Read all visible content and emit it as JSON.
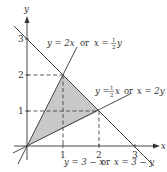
{
  "figure": {
    "type": "region-diagram",
    "axes": {
      "x_label": "x",
      "y_label": "y",
      "x_ticks": [
        "1",
        "2",
        "3"
      ],
      "y_ticks": [
        "1",
        "2",
        "3"
      ]
    },
    "lines": [
      {
        "id": "line-y-2x",
        "label_left": "y = 2x",
        "label_or": "or",
        "label_right_prefix": "x =",
        "label_frac_num": "1",
        "label_frac_den": "2",
        "label_right_suffix": "y"
      },
      {
        "id": "line-y-half-x",
        "label_left_prefix": "y =",
        "label_frac_num": "1",
        "label_frac_den": "2",
        "label_left_suffix": "x",
        "label_or": "or",
        "label_right": "x = 2y"
      },
      {
        "id": "line-y-3-minus-x",
        "label": "y = 3 − x",
        "label_or": "or",
        "label_right": "x = 3 − y"
      }
    ],
    "region": {
      "vertices": [
        [
          0,
          0
        ],
        [
          1,
          2
        ],
        [
          2,
          1
        ]
      ],
      "fill_color": "#c8c8c8"
    },
    "colors": {
      "line": "#333333",
      "axis": "#333333",
      "dashed": "#333333",
      "fill": "#c8c8c8"
    }
  }
}
